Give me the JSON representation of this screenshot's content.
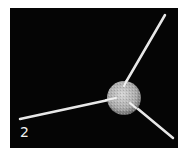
{
  "figure": {
    "panel_label": "2",
    "background_color": "#050505",
    "colors": {
      "arm": "#e8e8e8",
      "sphere": "#bdbdbd"
    }
  }
}
